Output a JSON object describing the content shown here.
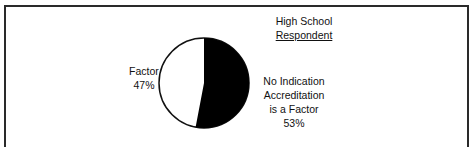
{
  "chart_data": {
    "type": "pie",
    "title": "High School",
    "subtitle": "Respondent",
    "slices": [
      {
        "label": "No Indication Accreditation is a Factor",
        "value": 53,
        "display": "53%",
        "color": "#000000"
      },
      {
        "label": "Factor",
        "value": 47,
        "display": "47%",
        "color": "#ffffff"
      }
    ],
    "legend": "none (direct labels)"
  },
  "labels": {
    "title_line1": "High School",
    "title_line2": "Respondent",
    "left_name": "Factor",
    "left_pct": "47%",
    "right_line1": "No Indication",
    "right_line2": "Accreditation",
    "right_line3": "is a Factor",
    "right_pct": "53%"
  }
}
